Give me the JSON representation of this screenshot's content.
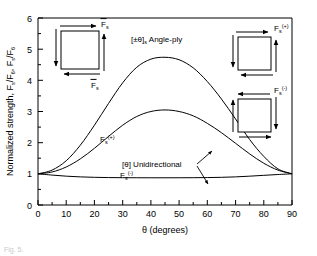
{
  "figure": {
    "caption": "Fig. 5.",
    "background": "#ffffff",
    "line_color": "#000000"
  },
  "chart_data": {
    "type": "line",
    "title": "",
    "xlabel": "θ (degrees)",
    "ylabel": "Normalized strength, F₆/F₆, Fₛ/F₆",
    "xlim": [
      0,
      90
    ],
    "ylim": [
      0,
      6
    ],
    "xticks": [
      0,
      10,
      20,
      30,
      40,
      50,
      60,
      70,
      80,
      90
    ],
    "yticks": [
      0,
      1,
      2,
      3,
      4,
      5,
      6
    ],
    "grid": false,
    "legend": "inline-labels",
    "x": [
      0,
      5,
      10,
      15,
      20,
      25,
      30,
      35,
      40,
      45,
      50,
      55,
      60,
      65,
      70,
      75,
      80,
      85,
      90
    ],
    "series": [
      {
        "name": "F̅ₛ",
        "label": "Fs-bar",
        "values": [
          1.0,
          1.12,
          1.42,
          1.92,
          2.56,
          3.26,
          3.92,
          4.42,
          4.68,
          4.74,
          4.66,
          4.4,
          3.96,
          3.4,
          2.76,
          2.1,
          1.56,
          1.16,
          1.0
        ]
      },
      {
        "name": "Fₛ⁽⁺⁾",
        "label": "Fs-plus",
        "values": [
          1.0,
          1.06,
          1.22,
          1.48,
          1.82,
          2.2,
          2.56,
          2.84,
          3.0,
          3.05,
          3.0,
          2.86,
          2.62,
          2.32,
          1.98,
          1.64,
          1.34,
          1.12,
          1.0
        ]
      },
      {
        "name": "Fₛ⁽⁻⁾",
        "label": "Fs-minus",
        "values": [
          1.0,
          0.96,
          0.925,
          0.902,
          0.888,
          0.88,
          0.876,
          0.874,
          0.873,
          0.873,
          0.874,
          0.876,
          0.88,
          0.888,
          0.902,
          0.925,
          0.952,
          0.978,
          1.0
        ]
      }
    ],
    "annotations": [
      {
        "name": "angle-ply-label",
        "text": "[±θ]ₛ Angle-ply",
        "x": 45,
        "y": 5.35
      },
      {
        "name": "unidirectional-label",
        "text": "[θ] Unidirectional",
        "x": 52,
        "y": 1.62
      },
      {
        "name": "fs-bar-curve-label",
        "text": "F̅ₛ",
        "x": 27,
        "y": 3.72
      },
      {
        "name": "fs-plus-curve-label",
        "text": "Fₛ⁽⁺⁾",
        "x": 30,
        "y": 2.25
      },
      {
        "name": "fs-minus-curve-label",
        "text": "Fₛ⁽⁻⁾",
        "x": 37,
        "y": 1.25
      }
    ]
  },
  "labels": {
    "y_axis_title": "Normalized strength, F₆/F₆, Fₛ/F₆",
    "y_axis_title_parts": {
      "prefix": "Normalized strength, ",
      "term1_base": "F",
      "term1_sub": "s",
      "term1_over": "¯",
      "slash": "/",
      "denom_base": "F",
      "denom_sub": "6",
      "sep": ", ",
      "term2_base": "F",
      "term2_sub": "s"
    },
    "x_axis_title": "θ (degrees)",
    "x_tick_labels": [
      "0",
      "10",
      "20",
      "30",
      "40",
      "50",
      "60",
      "70",
      "80",
      "90"
    ],
    "y_tick_labels": [
      "0",
      "1",
      "2",
      "3",
      "4",
      "5",
      "6"
    ],
    "angle_ply": "[±θ]ₛ Angle-ply",
    "angle_ply_bracket": "[±θ]",
    "angle_ply_sub": "s",
    "angle_ply_rest": " Angle-ply",
    "unidirectional": "[θ] Unidirectional",
    "curve_fs_bar": "F̅ₛ",
    "curve_fs_plus": "Fₛ⁽⁺⁾",
    "curve_fs_minus": "Fₛ⁽⁻⁾"
  },
  "insets": [
    {
      "name": "inset-crosshatch-fs-bar",
      "hatch": "cross",
      "label_base": "F",
      "label_sub": "s",
      "label_over": true,
      "label_sup": "",
      "top_arrow_dir": "right",
      "right_arrow_dir": "up",
      "bottom_arrow_dir": "left",
      "left_arrow_dir": "down"
    },
    {
      "name": "inset-diagonal-fs-plus",
      "hatch": "diagonal",
      "label_base": "F",
      "label_sub": "s",
      "label_over": false,
      "label_sup": "(+)",
      "top_arrow_dir": "right",
      "right_arrow_dir": "up",
      "bottom_arrow_dir": "left",
      "left_arrow_dir": "down"
    },
    {
      "name": "inset-diagonal-fs-minus",
      "hatch": "diagonal",
      "label_base": "F",
      "label_sub": "s",
      "label_over": false,
      "label_sup": "(-)",
      "top_arrow_dir": "left",
      "right_arrow_dir": "down",
      "bottom_arrow_dir": "right",
      "left_arrow_dir": "up"
    }
  ]
}
